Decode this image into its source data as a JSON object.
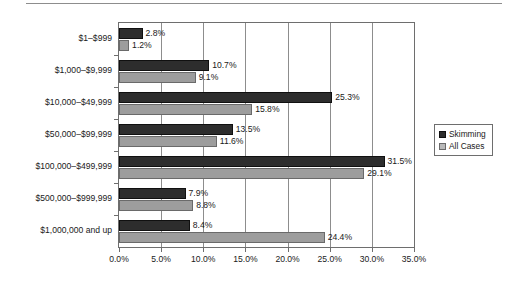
{
  "chart_data": {
    "type": "bar",
    "orientation": "horizontal",
    "title": "",
    "xlabel": "",
    "ylabel": "",
    "xlim": [
      0,
      35
    ],
    "xticks": [
      "0.0%",
      "5.0%",
      "10.0%",
      "15.0%",
      "20.0%",
      "25.0%",
      "30.0%",
      "35.0%"
    ],
    "xtick_values": [
      0,
      5,
      10,
      15,
      20,
      25,
      30,
      35
    ],
    "grid": true,
    "grid_axis": "x",
    "legend_position": "right",
    "categories": [
      "$1–$999",
      "$1,000–$9,999",
      "$10,000–$49,999",
      "$50,000–$99,999",
      "$100,000–$499,999",
      "$500,000–$999,999",
      "$1,000,000 and up"
    ],
    "series": [
      {
        "name": "Skimming",
        "color": "#2d2d2d",
        "values": [
          2.8,
          10.7,
          25.3,
          13.5,
          31.5,
          7.9,
          8.4
        ],
        "labels": [
          "2.8%",
          "10.7%",
          "25.3%",
          "13.5%",
          "31.5%",
          "7.9%",
          "8.4%"
        ]
      },
      {
        "name": "All Cases",
        "color": "#9d9d9d",
        "values": [
          1.2,
          9.1,
          15.8,
          11.6,
          29.1,
          8.8,
          24.4
        ],
        "labels": [
          "1.2%",
          "9.1%",
          "15.8%",
          "11.6%",
          "29.1%",
          "8.8%",
          "24.4%"
        ]
      }
    ]
  },
  "legend": {
    "items": [
      {
        "label": "Skimming"
      },
      {
        "label": "All Cases"
      }
    ]
  }
}
